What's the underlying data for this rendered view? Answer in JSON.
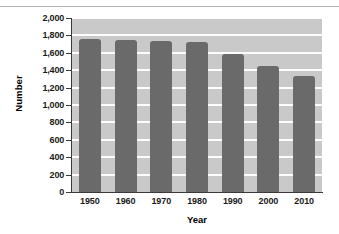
{
  "chart_data": {
    "type": "bar",
    "title": "",
    "xlabel": "Year",
    "ylabel": "Number",
    "categories": [
      "1950",
      "1960",
      "1970",
      "1980",
      "1990",
      "2000",
      "2010"
    ],
    "values": [
      1755,
      1745,
      1735,
      1720,
      1585,
      1450,
      1330
    ],
    "ylim": [
      0,
      2000
    ],
    "ytick_values": [
      0,
      200,
      400,
      600,
      800,
      1000,
      1200,
      1400,
      1600,
      1800,
      2000
    ],
    "ytick_labels": [
      "0",
      "200",
      "400",
      "600",
      "800",
      "1,000",
      "1,200",
      "1,400",
      "1,600",
      "1,800",
      "2,000"
    ],
    "grid": "horizontal-white-lines",
    "legend": "none",
    "bar_color": "#6a6a6a",
    "plot_background": "#c9c9c9",
    "gridline_color": "#fdfdfd",
    "axis_color": "#3a3a3a",
    "figure_background": "#ffffff"
  },
  "axes": {
    "y_title": "Number",
    "x_title": "Year"
  },
  "decor": {
    "top_rule_color": "#b4b4b4"
  }
}
